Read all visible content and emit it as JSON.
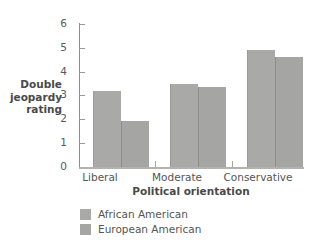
{
  "chart_data": {
    "type": "bar",
    "title": "",
    "subtitle": "",
    "xlabel": "Political orientation",
    "ylabel": "Double jeopardy rating",
    "ylabel_lines": [
      "Double",
      "jeopardy",
      "rating"
    ],
    "categories": [
      "Liberal",
      "Moderate",
      "Conservative"
    ],
    "series": [
      {
        "name": "African American",
        "color": "#a9a9a7",
        "values": [
          3.2,
          3.5,
          4.9
        ]
      },
      {
        "name": "European American",
        "color": "#a5a5a3",
        "values": [
          1.95,
          3.35,
          4.6
        ]
      }
    ],
    "ylim": [
      0,
      6
    ],
    "ytick_labels": [
      "0",
      "1",
      "2",
      "3",
      "4",
      "5",
      "6"
    ],
    "ytick_values": [
      0,
      1,
      2,
      3,
      4,
      5,
      6
    ],
    "grid": false,
    "legend_position": "below-left",
    "axis_color": "#8d8d8d",
    "background": "#ffffff"
  }
}
